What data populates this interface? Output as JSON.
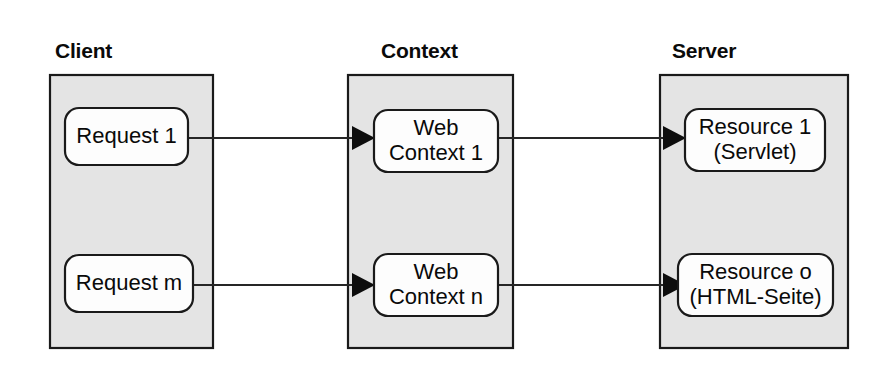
{
  "diagram": {
    "colors": {
      "zone_fill": "#e4e4e4",
      "zone_stroke": "#1a1a1a",
      "node_fill": "#fdfdfd",
      "node_stroke": "#1a1a1a",
      "arrow": "#0d0d0d",
      "text": "#0a0a0a",
      "background": "#ffffff"
    },
    "zones": [
      {
        "id": "client",
        "label": "Client"
      },
      {
        "id": "context",
        "label": "Context"
      },
      {
        "id": "server",
        "label": "Server"
      }
    ],
    "nodes": [
      {
        "id": "request-1",
        "zone": "client",
        "row": "top",
        "line1": "Request 1",
        "line2": ""
      },
      {
        "id": "request-m",
        "zone": "client",
        "row": "bottom",
        "line1": "Request m",
        "line2": ""
      },
      {
        "id": "web-context-1",
        "zone": "context",
        "row": "top",
        "line1": "Web",
        "line2": "Context 1"
      },
      {
        "id": "web-context-n",
        "zone": "context",
        "row": "bottom",
        "line1": "Web",
        "line2": "Context n"
      },
      {
        "id": "resource-1",
        "zone": "server",
        "row": "top",
        "line1": "Resource 1",
        "line2": "(Servlet)"
      },
      {
        "id": "resource-o",
        "zone": "server",
        "row": "bottom",
        "line1": "Resource o",
        "line2": "(HTML-Seite)"
      }
    ],
    "connections": [
      {
        "id": "req1-to-ctx1",
        "from": "request-1",
        "to": "web-context-1",
        "arrowhead": "end"
      },
      {
        "id": "ctx1-to-res1",
        "from": "web-context-1",
        "to": "resource-1",
        "arrowhead": "end"
      },
      {
        "id": "reqm-to-ctxn",
        "from": "request-m",
        "to": "web-context-n",
        "arrowhead": "end"
      },
      {
        "id": "ctxn-to-reso",
        "from": "web-context-n",
        "to": "resource-o",
        "arrowhead": "end"
      }
    ]
  }
}
